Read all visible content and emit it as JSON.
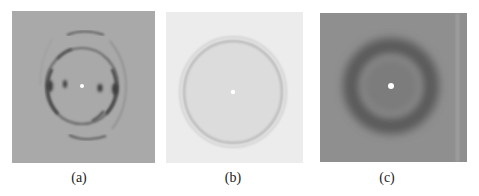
{
  "figure": {
    "panels": [
      {
        "id": "a",
        "caption": "(a)",
        "description": "Diffraction pattern with an elliptical ring, strong equatorial reflections and outer meridional arcs",
        "background": "#a9a9a9"
      },
      {
        "id": "b",
        "caption": "(b)",
        "description": "Diffraction pattern with a faint, uniform circular ring",
        "background": "#ececec"
      },
      {
        "id": "c",
        "caption": "(c)",
        "description": "Diffraction pattern with a broad diffuse dark halo ring",
        "background": "#8f8f8f"
      }
    ]
  }
}
